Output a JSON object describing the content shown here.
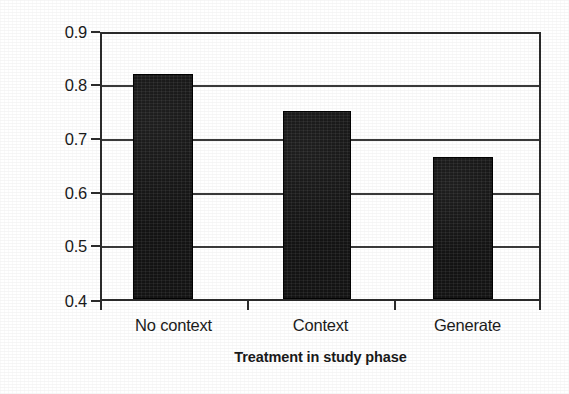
{
  "chart_data": {
    "type": "bar",
    "title": "",
    "xlabel": "Treatment in study phase",
    "ylabel": "Probability of identification",
    "categories": [
      "No context",
      "Context",
      "Generate"
    ],
    "values": [
      0.825,
      0.755,
      0.668
    ],
    "series": [
      {
        "name": "Probability of identification",
        "values": [
          0.825,
          0.755,
          0.668
        ]
      }
    ],
    "ylim": [
      0.4,
      0.9
    ],
    "ytick_labels": [
      "0.9",
      "0.8",
      "0.7",
      "0.6",
      "0.5",
      "0.4"
    ],
    "ytick_values": [
      0.9,
      0.8,
      0.7,
      0.6,
      0.5,
      0.4
    ],
    "grid": true,
    "legend": "none",
    "bar_color": "#141414",
    "axis_color": "#2b2b2b",
    "background_color": "#ffffff"
  },
  "axes": {
    "y_title": "Probability of identification",
    "x_title": "Treatment in study phase"
  }
}
